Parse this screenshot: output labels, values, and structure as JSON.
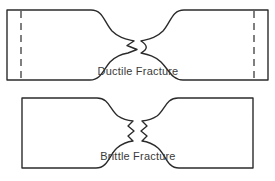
{
  "figure": {
    "background_color": "#ffffff",
    "line_color": "#2b2b2b",
    "text_color": "#3a3a3a",
    "width": 275,
    "height": 181
  },
  "specimens": [
    {
      "id": "ductile",
      "label": "Ductile Fracture",
      "fracture_type": "cup-and-cone",
      "has_grip_dashed_lines": true,
      "necking": "pronounced",
      "body_top": 10,
      "body_bottom": 80,
      "left_edge": 7,
      "right_edge": 268,
      "left_dash_x": 21,
      "right_dash_x": 254,
      "neck_top_y": 40,
      "neck_bottom_y": 52,
      "label_x": 138,
      "label_y": 75
    },
    {
      "id": "brittle",
      "label": "Brittle Fracture",
      "fracture_type": "jagged-flat",
      "has_grip_dashed_lines": false,
      "necking": "minimal",
      "body_top": 98,
      "body_bottom": 168,
      "left_edge": 22,
      "right_edge": 253,
      "neck_top_y": 118,
      "neck_bottom_y": 146,
      "label_x": 138,
      "label_y": 160
    }
  ],
  "labels": {
    "ductile_fracture": "Ductile Fracture",
    "brittle_fracture": "Brittle Fracture"
  }
}
